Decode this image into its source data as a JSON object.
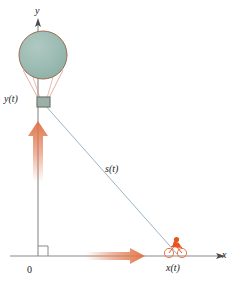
{
  "figure": {
    "background_color": "#ffffff",
    "axes": {
      "x_label": "x",
      "y_label": "y",
      "origin_label": "0",
      "axis_color": "#8a8a8a",
      "origin_x": 38,
      "origin_y": 256,
      "x_axis_end": 220,
      "y_axis_top": 22,
      "right_angle_marker": true
    },
    "labels": {
      "height_label": "y(t)",
      "distance_label": "x(t)",
      "hypotenuse_label": "s(t)"
    },
    "balloon": {
      "name": "hot-air-balloon",
      "envelope_center_x": 43,
      "envelope_center_y": 55,
      "envelope_radius": 24,
      "envelope_fill": "#9cbcb4",
      "envelope_stroke": "#9b6b52",
      "rope_color": "#d4917a",
      "basket_x": 37,
      "basket_y": 97,
      "basket_width": 13,
      "basket_height": 10,
      "basket_fill": "#9cb0a8",
      "basket_stroke": "#6d7a74"
    },
    "cyclist": {
      "name": "cyclist-on-bicycle",
      "x": 176,
      "y": 251,
      "body_color": "#e8531f",
      "wheel_color": "#e8663a"
    },
    "vectors": {
      "vertical": {
        "name": "vertical-velocity-arrow",
        "color": "#e07a50",
        "direction": "up",
        "x": 38,
        "tail_y": 180,
        "head_y": 123
      },
      "horizontal": {
        "name": "horizontal-velocity-arrow",
        "color": "#e07a50",
        "direction": "right",
        "y": 256,
        "tail_x": 88,
        "head_x": 143
      }
    },
    "hypotenuse": {
      "name": "distance-line",
      "color": "#9bb4c4",
      "from_x": 44,
      "from_y": 104,
      "to_x": 176,
      "to_y": 254
    }
  }
}
